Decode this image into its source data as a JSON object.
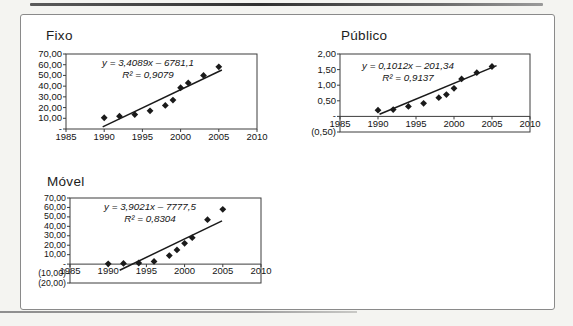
{
  "figure": {
    "page_background": "#f4f4f1",
    "panel_background": "#ffffff",
    "ink_color": "#1a1a1a",
    "frame_color": "#3c3c3c"
  },
  "chart_data": [
    {
      "type": "scatter",
      "title": "Fixo",
      "xlim": [
        1985,
        2010
      ],
      "ylim": [
        0,
        70
      ],
      "axis_cross_y": 0,
      "grid": false,
      "legend": "none",
      "marker": "diamond",
      "x": [
        1990,
        1992,
        1994,
        1996,
        1998,
        1999,
        2000,
        2001,
        2003,
        2005
      ],
      "values": [
        10.5,
        12,
        13.5,
        17,
        22,
        27,
        38.5,
        43,
        50,
        58
      ],
      "trendline": {
        "slope": 3.4089,
        "intercept": -6781.1,
        "x_start": 1989.8,
        "x_end": 2005.4,
        "equation_label": "y = 3,4089x – 6781,1",
        "r2_label": "R² = 0,9079"
      },
      "x_ticks": {
        "values": [
          1985,
          1990,
          1995,
          2000,
          2005,
          2010
        ],
        "labels": [
          "1985",
          "1990",
          "1995",
          "2000",
          "2005",
          "2010"
        ]
      },
      "y_ticks": {
        "values": [
          70,
          60,
          50,
          40,
          30,
          20,
          10,
          0
        ],
        "labels": [
          "70,00",
          "60,00",
          "50,00",
          "40,00",
          "30,00",
          "20,00",
          "10,00",
          "-"
        ]
      }
    },
    {
      "type": "scatter",
      "title": "Público",
      "xlim": [
        1985,
        2010
      ],
      "ylim": [
        -0.5,
        2
      ],
      "axis_cross_y": 0,
      "grid": false,
      "legend": "none",
      "marker": "diamond",
      "x": [
        1990,
        1992,
        1994,
        1996,
        1998,
        1999,
        2000,
        2001,
        2003,
        2005
      ],
      "values": [
        0.2,
        0.22,
        0.32,
        0.42,
        0.6,
        0.7,
        0.9,
        1.2,
        1.4,
        1.6
      ],
      "trendline": {
        "slope": 0.1012,
        "intercept": -201.34,
        "x_start": 1990.2,
        "x_end": 2005.6,
        "equation_label": "y = 0,1012x – 201,34",
        "r2_label": "R² = 0,9137"
      },
      "x_ticks": {
        "values": [
          1985,
          1990,
          1995,
          2000,
          2005,
          2010
        ],
        "labels": [
          "1985",
          "1990",
          "1995",
          "2000",
          "2005",
          "2010"
        ]
      },
      "y_ticks": {
        "values": [
          2,
          1.5,
          1,
          0.5,
          0,
          -0.5
        ],
        "labels": [
          "2,00",
          "1,50",
          "1,00",
          "0,50",
          "-",
          "(0,50)"
        ]
      }
    },
    {
      "type": "scatter",
      "title": "Móvel",
      "xlim": [
        1985,
        2010
      ],
      "ylim": [
        -20,
        70
      ],
      "axis_cross_y": 0,
      "grid": false,
      "legend": "none",
      "marker": "diamond",
      "x": [
        1990,
        1992,
        1994,
        1996,
        1998,
        1999,
        2000,
        2001,
        2003,
        2005
      ],
      "values": [
        0.3,
        0.7,
        1.2,
        2.8,
        9,
        15,
        22,
        28,
        47,
        58
      ],
      "trendline": {
        "slope": 3.9021,
        "intercept": -7777.5,
        "x_start": 1991.5,
        "x_end": 2004.9,
        "equation_label": "y = 3,9021x – 7777,5",
        "r2_label": "R² = 0,8304"
      },
      "x_ticks": {
        "values": [
          1985,
          1990,
          1995,
          2000,
          2005,
          2010
        ],
        "labels": [
          "1985",
          "1990",
          "1995",
          "2000",
          "2005",
          "2010"
        ]
      },
      "y_ticks": {
        "values": [
          70,
          60,
          50,
          40,
          30,
          20,
          10,
          0,
          -10,
          -20
        ],
        "labels": [
          "70,00",
          "60,00",
          "50,00",
          "40,00",
          "30,00",
          "20,00",
          "10,00",
          "-",
          "(10,00)",
          "(20,00)"
        ]
      }
    }
  ]
}
